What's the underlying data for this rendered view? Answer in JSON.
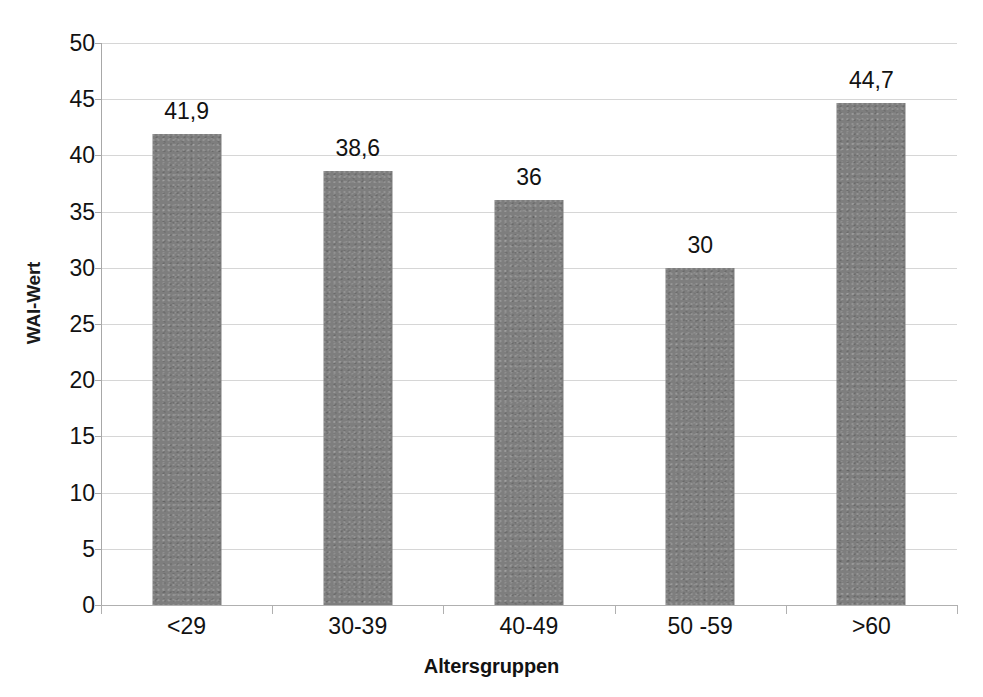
{
  "chart_data": {
    "type": "bar",
    "title": "",
    "categories": [
      "<29",
      "30-39",
      "40-49",
      "50 -59",
      ">60"
    ],
    "values": [
      41.9,
      38.6,
      36,
      30,
      44.7
    ],
    "data_labels": [
      "41,9",
      "38,6",
      "36",
      "30",
      "44,7"
    ],
    "xlabel": "Altersgruppen",
    "ylabel": "WAI-Wert",
    "ylim": [
      0,
      50
    ],
    "ytick_labels": [
      "0",
      "5",
      "10",
      "15",
      "20",
      "25",
      "30",
      "35",
      "40",
      "45",
      "50"
    ],
    "ytick_values": [
      0,
      5,
      10,
      15,
      20,
      25,
      30,
      35,
      40,
      45,
      50
    ],
    "grid": true,
    "legend": false,
    "series": [
      {
        "name": "WAI-Wert",
        "color": "#7e7e7e",
        "values": [
          41.9,
          38.6,
          36,
          30,
          44.7
        ]
      }
    ]
  },
  "style": {
    "bar_color": "#7e7e7e",
    "grid_color": "#cfcfcf",
    "axis_color": "#a8a8a8",
    "text_color": "#121212",
    "background": "#ffffff"
  }
}
